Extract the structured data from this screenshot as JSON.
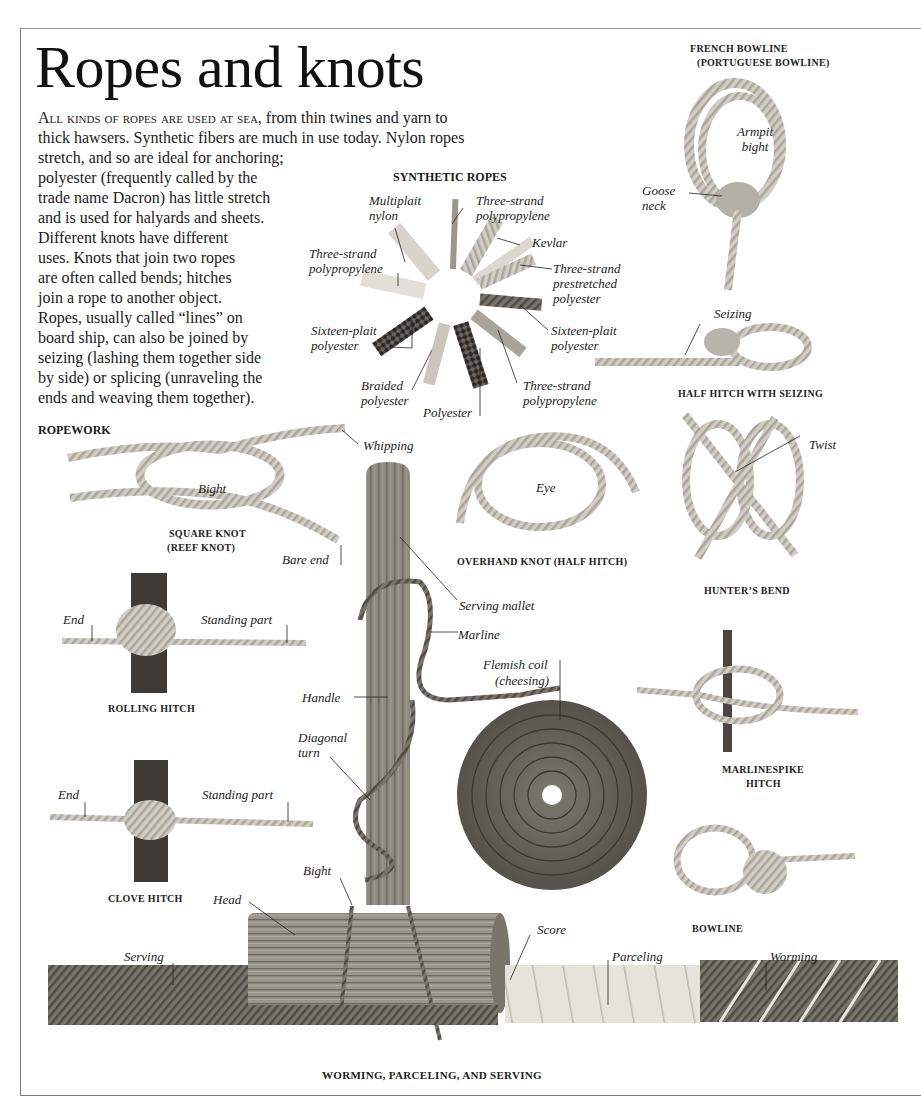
{
  "page": {
    "title": "Ropes and knots",
    "intro_lead": "All kinds of ropes are used at sea",
    "intro_lines": [
      ", from thin twines and yarn to",
      "thick hawsers. Synthetic fibers are much in use today. Nylon ropes",
      "stretch, and so are ideal for anchoring;",
      "polyester (frequently called by the",
      "trade name Dacron) has little stretch",
      "and is used for halyards and sheets.",
      "Different knots have different",
      "uses. Knots that join two ropes",
      "are often called bends; hitches",
      "join a rope to another object.",
      "Ropes, usually called “lines” on",
      "board ship, can also be joined by",
      "seizing (lashing them together side",
      "by side) or splicing (unraveling the",
      "ends and weaving them together)."
    ]
  },
  "sections": {
    "synthetic_ropes": {
      "heading": "SYNTHETIC ROPES",
      "labels": [
        "Multiplait nylon",
        "Three-strand polypropylene",
        "Kevlar",
        "Three-strand prestretched polyester",
        "Three-strand polypropylene",
        "Sixteen-plait polyester",
        "Sixteen-plait polyester",
        "Braided polyester",
        "Polyester",
        "Three-strand polypropylene"
      ]
    },
    "french_bowline": {
      "caption_1": "FRENCH BOWLINE",
      "caption_2": "(PORTUGUESE BOWLINE)",
      "labels": {
        "armpit_bight": "Armpit bight",
        "goose_neck": "Goose neck"
      }
    },
    "half_hitch_seizing": {
      "caption": "HALF HITCH WITH SEIZING",
      "labels": {
        "seizing": "Seizing"
      }
    },
    "ropework": {
      "heading": "ROPEWORK"
    },
    "square_knot": {
      "caption_1": "SQUARE KNOT",
      "caption_2": "(REEF KNOT)",
      "labels": {
        "bight": "Bight",
        "whipping": "Whipping",
        "bare_end": "Bare end"
      }
    },
    "overhand_knot": {
      "caption": "OVERHAND KNOT (HALF HITCH)",
      "labels": {
        "eye": "Eye"
      }
    },
    "hunters_bend": {
      "caption": "HUNTER’S BEND",
      "labels": {
        "twist": "Twist"
      }
    },
    "rolling_hitch": {
      "caption": "ROLLING HITCH",
      "labels": {
        "end": "End",
        "standing_part": "Standing part"
      }
    },
    "clove_hitch": {
      "caption": "CLOVE HITCH",
      "labels": {
        "end": "End",
        "standing_part": "Standing part"
      }
    },
    "serving_mallet": {
      "labels": {
        "serving_mallet": "Serving mallet",
        "marline": "Marline",
        "handle": "Handle",
        "diagonal_turn": "Diagonal turn",
        "bight": "Bight",
        "head": "Head",
        "score": "Score"
      }
    },
    "flemish_coil": {
      "labels": {
        "line1": "Flemish coil",
        "line2": "(cheesing)"
      }
    },
    "marlinespike_hitch": {
      "caption_1": "MARLINESPIKE",
      "caption_2": "HITCH"
    },
    "bowline": {
      "caption": "BOWLINE"
    },
    "worming": {
      "caption": "WORMING, PARCELING, AND SERVING",
      "labels": {
        "serving": "Serving",
        "parceling": "Parceling",
        "worming": "Worming"
      }
    }
  },
  "colors": {
    "rope_light": "#cfcbc2",
    "rope_dark": "#6e6a62",
    "wood": "#8a857c",
    "text": "#1a1a1a"
  }
}
